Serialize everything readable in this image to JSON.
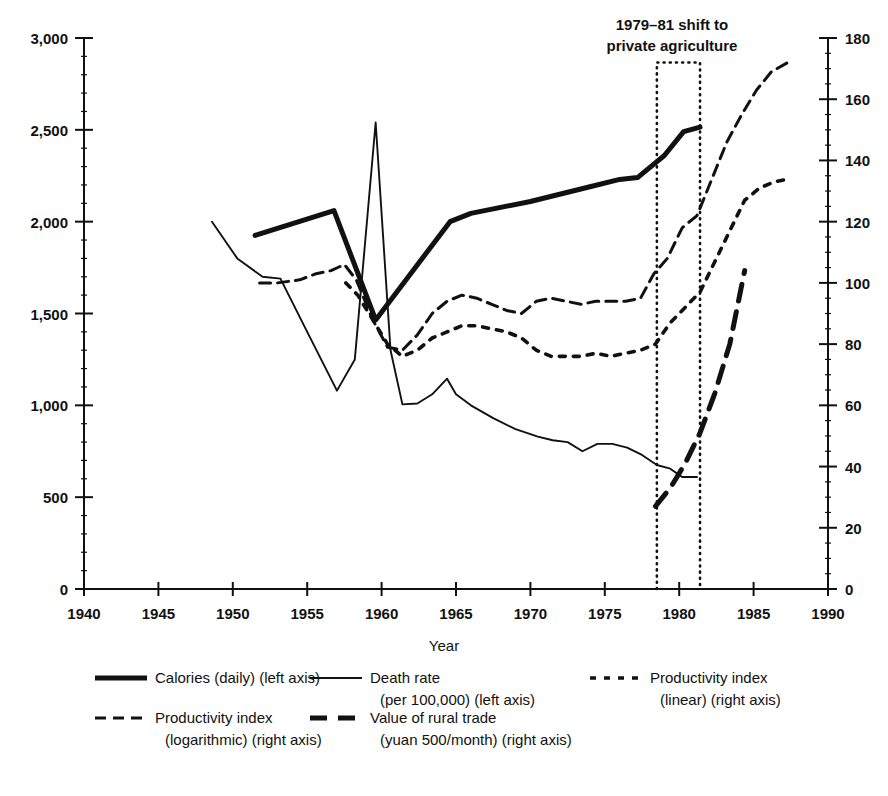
{
  "chart_data": {
    "type": "line",
    "title": "",
    "xlabel": "Year",
    "ylabel": "",
    "grid": false,
    "legend_position": "bottom",
    "xlim": [
      1940,
      1990
    ],
    "xticks": [
      1940,
      1945,
      1950,
      1955,
      1960,
      1965,
      1970,
      1975,
      1980,
      1985,
      1990
    ],
    "xtick_labels": [
      "1940",
      "1945",
      "1950",
      "1955",
      "1960",
      "1965",
      "1970",
      "1975",
      "1980",
      "1985",
      "1990"
    ],
    "left_axis": {
      "lim": [
        0,
        3000
      ],
      "ticks": [
        0,
        500,
        1000,
        1500,
        2000,
        2500,
        3000
      ],
      "tick_labels": [
        "0",
        "500",
        "1,000",
        "1,500",
        "2,000",
        "2,500",
        "3,000"
      ],
      "minor_step": 100
    },
    "right_axis": {
      "lim": [
        0,
        180
      ],
      "ticks": [
        0,
        20,
        40,
        60,
        80,
        100,
        120,
        140,
        160,
        180
      ],
      "tick_labels": [
        "0",
        "20",
        "40",
        "60",
        "80",
        "100",
        "120",
        "140",
        "160",
        "180"
      ],
      "minor_step": 5
    },
    "annotations": [
      {
        "name": "private-agriculture-shift",
        "text_line1": "1979–81 shift to",
        "text_line2": "private agriculture",
        "box_x_start": 1978.5,
        "box_x_end": 1981.4,
        "box_y_top_right_axis": 172,
        "box_y_bottom_right_axis": 0
      }
    ],
    "series": [
      {
        "name": "Calories (daily) (left axis)",
        "short_name": "calories",
        "axis": "left",
        "style": "solid-thick",
        "units": "calories per day",
        "x": [
          1951.5,
          1956.8,
          1959.6,
          1964.6,
          1966.0,
          1970.0,
          1974.0,
          1976.0,
          1977.2,
          1979.0,
          1980.3,
          1981.4
        ],
        "y": [
          1925,
          2060,
          1465,
          2000,
          2045,
          2110,
          2190,
          2230,
          2240,
          2360,
          2490,
          2515
        ]
      },
      {
        "name": "Death rate (per 100,000) (left axis)",
        "short_name": "death_rate",
        "axis": "left",
        "style": "solid-thin",
        "units": "per 100,000",
        "x": [
          1948.6,
          1950.3,
          1952.0,
          1953.2,
          1955.0,
          1957.0,
          1958.2,
          1959.6,
          1960.6,
          1961.4,
          1962.4,
          1963.4,
          1964.4,
          1965.0,
          1966.0,
          1967.5,
          1969.0,
          1970.5,
          1971.5,
          1972.5,
          1973.5,
          1974.5,
          1975.5,
          1976.5,
          1977.5,
          1978.5,
          1979.4,
          1980.2,
          1981.2
        ],
        "y": [
          2000,
          1800,
          1700,
          1690,
          1400,
          1080,
          1250,
          2540,
          1300,
          1005,
          1010,
          1060,
          1145,
          1060,
          1000,
          930,
          870,
          830,
          810,
          800,
          750,
          790,
          790,
          770,
          730,
          675,
          655,
          610,
          610
        ]
      },
      {
        "name": "Productivity index (logarithmic) (right axis)",
        "short_name": "productivity_log",
        "axis": "right",
        "style": "dashed",
        "units": "index",
        "x": [
          1951.8,
          1953.0,
          1954.5,
          1955.6,
          1956.6,
          1957.5,
          1958.3,
          1959.4,
          1960.4,
          1961.4,
          1962.4,
          1963.4,
          1964.4,
          1965.4,
          1966.4,
          1967.4,
          1968.4,
          1969.4,
          1970.4,
          1971.4,
          1972.4,
          1973.4,
          1974.4,
          1975.4,
          1976.4,
          1977.4,
          1978.3,
          1979.2,
          1980.2,
          1981.2,
          1982.2,
          1983.2,
          1984.2,
          1985.2,
          1986.2,
          1987.3
        ],
        "y": [
          100,
          100,
          101,
          103,
          104,
          106,
          101,
          88,
          79,
          78,
          83,
          90,
          94,
          96,
          95,
          93,
          91,
          90,
          94,
          95,
          94,
          93,
          94,
          94,
          94,
          95,
          103,
          108,
          118,
          122,
          134,
          146,
          155,
          163,
          169,
          172
        ]
      },
      {
        "name": "Productivity index (linear) (right axis)",
        "short_name": "productivity_linear",
        "axis": "right",
        "style": "dotted",
        "units": "index",
        "x": [
          1957.6,
          1958.4,
          1959.4,
          1960.4,
          1961.4,
          1962.4,
          1963.4,
          1964.4,
          1965.4,
          1966.4,
          1967.4,
          1968.4,
          1969.4,
          1970.4,
          1971.4,
          1972.4,
          1973.4,
          1974.4,
          1975.4,
          1976.4,
          1977.4,
          1978.4,
          1979.4,
          1980.4,
          1981.4,
          1982.4,
          1983.4,
          1984.4,
          1985.4,
          1986.4,
          1987.4
        ],
        "y": [
          100,
          96,
          88,
          80,
          76,
          78,
          82,
          84,
          86,
          86,
          85,
          84,
          82,
          78,
          76,
          76,
          76,
          77,
          76,
          77,
          78,
          80,
          87,
          92,
          97,
          107,
          117,
          127,
          131,
          133,
          134
        ]
      },
      {
        "name": "Value of rural trade (yuan 500/month) (right axis)",
        "short_name": "rural_trade",
        "axis": "right",
        "style": "long-dashed",
        "units": "yuan 500/month",
        "x": [
          1978.4,
          1979.4,
          1980.4,
          1981.4,
          1982.4,
          1983.4,
          1984.4
        ],
        "y": [
          27,
          33,
          41,
          51,
          64,
          80,
          104
        ]
      }
    ]
  },
  "annotation": {
    "line1": "1979–81 shift to",
    "line2": "private agriculture"
  },
  "axis_titles": {
    "x": "Year"
  },
  "legend": {
    "items": [
      {
        "key": "calories",
        "style": "solid-thick",
        "label_line1": "Calories (daily) (left axis)",
        "label_line2": ""
      },
      {
        "key": "death_rate",
        "style": "solid-thin",
        "label_line1": "Death rate",
        "label_line2": "(per 100,000) (left axis)"
      },
      {
        "key": "productivity_linear",
        "style": "dotted",
        "label_line1": "Productivity index",
        "label_line2": "(linear) (right axis)"
      },
      {
        "key": "productivity_log",
        "style": "dashed",
        "label_line1": "Productivity index",
        "label_line2": "(logarithmic) (right axis)"
      },
      {
        "key": "rural_trade",
        "style": "long-dashed",
        "label_line1": "Value of rural trade",
        "label_line2": "(yuan 500/month) (right axis)"
      }
    ]
  },
  "colors": {
    "ink": "#111111",
    "background": "#ffffff"
  }
}
